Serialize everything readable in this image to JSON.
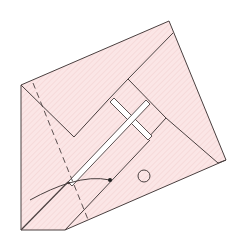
{
  "diagram": {
    "type": "origami-folding-step",
    "paper_color": "#fbe6e6",
    "line_color": "#4a4040",
    "hatch_color": "#f3d3d3",
    "outer_outline": [
      [
        21,
        85
      ],
      [
        169,
        21
      ],
      [
        226,
        160
      ],
      [
        65,
        230
      ],
      [
        21,
        230
      ]
    ],
    "top_flap": [
      [
        21,
        85
      ],
      [
        169,
        21
      ],
      [
        173,
        33
      ],
      [
        128,
        79
      ],
      [
        108,
        100
      ],
      [
        74,
        137
      ]
    ],
    "inner_square": [
      [
        128,
        79
      ],
      [
        166,
        118
      ],
      [
        147,
        139
      ],
      [
        108,
        100
      ]
    ],
    "slit_band_a": [
      [
        110,
        102
      ],
      [
        147,
        139
      ]
    ],
    "slit_band_b": [
      [
        148,
        103
      ],
      [
        112,
        141
      ]
    ],
    "right_edge_inner": [
      [
        166,
        118
      ],
      [
        218,
        163
      ]
    ],
    "lower_flap": [
      [
        21,
        230
      ],
      [
        148,
        103
      ],
      [
        160,
        114
      ],
      [
        65,
        230
      ]
    ],
    "valley_fold_dashed": [
      [
        31,
        82
      ],
      [
        88,
        222
      ]
    ],
    "arrow_curve": {
      "from": [
        30,
        200
      ],
      "through": [
        69,
        183
      ],
      "to": [
        110,
        180
      ]
    },
    "marker_circle": {
      "cx": 144,
      "cy": 176,
      "r": 6
    },
    "arrow_dot": [
      110,
      180
    ]
  }
}
